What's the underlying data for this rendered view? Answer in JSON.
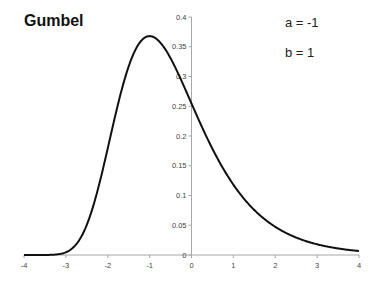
{
  "chart_data": {
    "type": "line",
    "title": "Gumbel",
    "annotations": [
      "a = -1",
      "b = 1"
    ],
    "xlabel": "",
    "ylabel": "",
    "xlim": [
      -4,
      4
    ],
    "ylim": [
      0,
      0.4
    ],
    "grid": false,
    "legend": "none",
    "x_ticks": [
      "-4",
      "-3",
      "-2",
      "-1",
      "0",
      "1",
      "2",
      "3",
      "4"
    ],
    "y_ticks": [
      "0",
      "0.05",
      "0.1",
      "0.15",
      "0.2",
      "0.25",
      "0.3",
      "0.35",
      "0.4"
    ],
    "series": [
      {
        "name": "Gumbel pdf (a=-1, b=1)",
        "x": [
          -4,
          -3.75,
          -3.5,
          -3.25,
          -3,
          -2.75,
          -2.5,
          -2.25,
          -2,
          -1.75,
          -1.5,
          -1.25,
          -1,
          -0.75,
          -0.5,
          -0.25,
          0,
          0.25,
          0.5,
          0.75,
          1,
          1.25,
          1.5,
          1.75,
          2,
          2.25,
          2.5,
          2.75,
          3,
          3.25,
          3.5,
          3.75,
          4
        ],
        "y": [
          0.0,
          0.0,
          0.0,
          0.0003,
          0.0045,
          0.0232,
          0.0654,
          0.1285,
          0.1794,
          0.2689,
          0.3299,
          0.3617,
          0.3679,
          0.3617,
          0.3467,
          0.3215,
          0.2546,
          0.2427,
          0.2102,
          0.1788,
          0.1182,
          0.1188,
          0.1002,
          0.0841,
          0.0474,
          0.0573,
          0.0471,
          0.0388,
          0.018,
          0.0378,
          0.0109,
          0.0227,
          0.0067
        ]
      }
    ],
    "distribution": {
      "name": "Gumbel",
      "a": -1,
      "b": 1
    }
  }
}
